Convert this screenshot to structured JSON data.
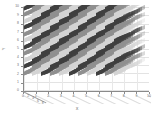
{
  "figure": {
    "background_color": "#ffffff",
    "width": 154,
    "height": 117,
    "axis_color": "#8a8a8a",
    "grid_color": "#e3e3e3",
    "tick_label_color": "#6e6e6e"
  },
  "chart_data": {
    "type": "bar",
    "subtype": "bar3-grid",
    "title": "",
    "xlabel": "X",
    "ylabel": "Y",
    "zlabel": "",
    "xlim": [
      0,
      10
    ],
    "ylim": [
      0,
      10
    ],
    "grid": true,
    "legend": null,
    "projection": "3d-oblique",
    "xticks": [
      0,
      1,
      2,
      3,
      4,
      5,
      6,
      7,
      8,
      9,
      10
    ],
    "xticklabels": [
      "0",
      "1",
      "2",
      "3",
      "4",
      "5",
      "6",
      "7",
      "8",
      "9",
      "10"
    ],
    "yticks": [
      0,
      1,
      2,
      3,
      4,
      5,
      6,
      7,
      8,
      9,
      10
    ],
    "yticklabels": [
      "0",
      "1",
      "2",
      "3",
      "4",
      "5",
      "6",
      "7",
      "8",
      "9",
      "10"
    ],
    "zticks": [
      0,
      2,
      4,
      6,
      8,
      10
    ],
    "zticklabels": [
      "0",
      "2",
      "4",
      "6",
      "8",
      "10"
    ],
    "rows": 11,
    "columns": 11,
    "colormap": "grayscale",
    "bar_face_color_dark": "#3f3f3f",
    "bar_face_color_mid": "#8f8f8f",
    "bar_face_color_light": "#d4d4d4",
    "categories": [
      "0",
      "1",
      "2",
      "3",
      "4",
      "5",
      "6",
      "7",
      "8",
      "9",
      "10"
    ],
    "series": [
      {
        "name": "row 0",
        "values": [
          5,
          5,
          5,
          5,
          5,
          5,
          5,
          5,
          5,
          5,
          5
        ]
      },
      {
        "name": "row 1",
        "values": [
          5,
          5,
          5,
          5,
          5,
          5,
          5,
          5,
          5,
          5,
          5
        ]
      },
      {
        "name": "row 2",
        "values": [
          5,
          5,
          5,
          5,
          5,
          5,
          5,
          5,
          5,
          5,
          5
        ]
      },
      {
        "name": "row 3",
        "values": [
          5,
          5,
          5,
          5,
          5,
          5,
          5,
          5,
          5,
          5,
          5
        ]
      },
      {
        "name": "row 4",
        "values": [
          5,
          5,
          5,
          5,
          5,
          5,
          5,
          5,
          5,
          5,
          5
        ]
      },
      {
        "name": "row 5",
        "values": [
          5,
          5,
          5,
          5,
          5,
          5,
          5,
          5,
          5,
          5,
          5
        ]
      },
      {
        "name": "row 6",
        "values": [
          5,
          5,
          5,
          5,
          5,
          5,
          5,
          5,
          5,
          5,
          5
        ]
      },
      {
        "name": "row 7",
        "values": [
          5,
          5,
          5,
          5,
          5,
          5,
          5,
          5,
          5,
          5,
          5
        ]
      },
      {
        "name": "row 8",
        "values": [
          5,
          5,
          5,
          5,
          5,
          5,
          5,
          5,
          5,
          5,
          5
        ]
      },
      {
        "name": "row 9",
        "values": [
          5,
          5,
          5,
          5,
          5,
          5,
          5,
          5,
          5,
          5,
          5
        ]
      },
      {
        "name": "row 10",
        "values": [
          5,
          5,
          5,
          5,
          5,
          5,
          5,
          5,
          5,
          5,
          5
        ]
      }
    ]
  }
}
